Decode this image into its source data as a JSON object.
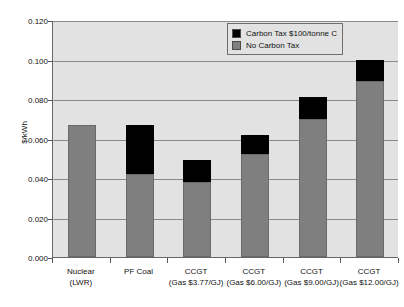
{
  "chart_data": {
    "type": "bar",
    "title": "",
    "subtitle": "",
    "xlabel": "",
    "ylabel": "$/kWh",
    "ylim": [
      0.0,
      0.12
    ],
    "ytick_step": 0.02,
    "ytick_labels": [
      "0.120",
      "0.100",
      "0.080",
      "0.060",
      "0.040",
      "0.020",
      "0.000"
    ],
    "ytick_values": [
      0.12,
      0.1,
      0.08,
      0.06,
      0.04,
      0.02,
      0.0
    ],
    "grid": true,
    "stacked": true,
    "legend_position": "top-right",
    "categories": [
      {
        "line1": "Nuclear",
        "line2": "(LWR)"
      },
      {
        "line1": "PF Coal",
        "line2": ""
      },
      {
        "line1": "CCGT",
        "line2": "(Gas $3.77/GJ)"
      },
      {
        "line1": "CCGT",
        "line2": "(Gas $6.00/GJ)"
      },
      {
        "line1": "CCGT",
        "line2": "(Gas $9.00/GJ)"
      },
      {
        "line1": "CCGT",
        "line2": "(Gas $12.00/GJ)"
      }
    ],
    "series": [
      {
        "name": "No Carbon Tax",
        "color": "#7f7f7f",
        "values": [
          0.067,
          0.042,
          0.038,
          0.052,
          0.07,
          0.089
        ]
      },
      {
        "name": "Carbon Tax $100/tonne C",
        "color": "#000000",
        "values": [
          0.0,
          0.025,
          0.011,
          0.01,
          0.011,
          0.011
        ]
      }
    ],
    "totals": [
      0.067,
      0.067,
      0.049,
      0.062,
      0.081,
      0.1
    ],
    "plot_background": "#e2e2e2",
    "gridline_color": "#8a8a8a",
    "axis_color": "#666666"
  },
  "legend": {
    "items": [
      {
        "label": "Carbon Tax $100/tonne C",
        "color": "#000000"
      },
      {
        "label": "No Carbon Tax",
        "color": "#7f7f7f"
      }
    ]
  }
}
